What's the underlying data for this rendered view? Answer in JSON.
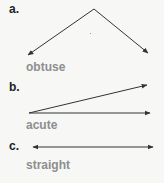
{
  "items": [
    {
      "letter": "a.",
      "name": "obtuse"
    },
    {
      "letter": "b.",
      "name": "acute"
    },
    {
      "letter": "c.",
      "name": "straight"
    }
  ],
  "colors": {
    "line": "#333333",
    "label": "#8e8e8e",
    "letter": "#222222"
  }
}
